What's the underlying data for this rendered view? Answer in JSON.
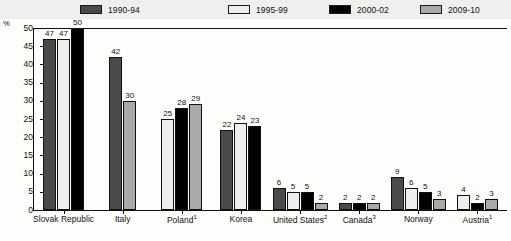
{
  "axis": {
    "unit_label": "%",
    "yticks": [
      "50",
      "45",
      "40",
      "35",
      "30",
      "25",
      "20",
      "15",
      "10",
      "5",
      "0"
    ]
  },
  "legend": {
    "items": [
      {
        "label": "1990-94",
        "color": "#4a4a4a",
        "icon": "legend-swatch-icon"
      },
      {
        "label": "1995-99",
        "color": "#eeeeec",
        "icon": "legend-swatch-icon"
      },
      {
        "label": "2000-02",
        "color": "#000000",
        "icon": "legend-swatch-icon"
      },
      {
        "label": "2009-10",
        "color": "#a9a9a7",
        "icon": "legend-swatch-icon"
      }
    ]
  },
  "chart_data": {
    "type": "bar",
    "title": "",
    "xlabel": "",
    "ylabel": "%",
    "ylim": [
      0,
      50
    ],
    "ytick_step": 5,
    "grid": false,
    "legend_position": "top",
    "categories": [
      "Slovak Republic",
      "Italy",
      "Poland",
      "Korea",
      "United States",
      "Canada",
      "Norway",
      "Austria"
    ],
    "category_footnotes": [
      "",
      "",
      "1",
      "",
      "2",
      "3",
      "",
      "1"
    ],
    "series": [
      {
        "name": "1990-94",
        "color": "#4a4a4a",
        "values": [
          47,
          42,
          null,
          22,
          6,
          2,
          9,
          null
        ]
      },
      {
        "name": "1995-99",
        "color": "#eeeeec",
        "values": [
          47,
          null,
          25,
          24,
          5,
          null,
          6,
          4
        ]
      },
      {
        "name": "2000-02",
        "color": "#000000",
        "values": [
          50,
          null,
          28,
          23,
          5,
          2,
          5,
          2
        ]
      },
      {
        "name": "2009-10",
        "color": "#a9a9a7",
        "values": [
          null,
          30,
          29,
          null,
          2,
          2,
          3,
          3
        ]
      }
    ]
  }
}
